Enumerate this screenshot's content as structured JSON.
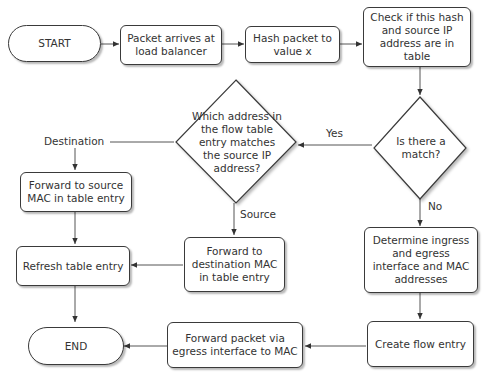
{
  "nodes": {
    "start": "START",
    "packet_arrives": "Packet arrives at load balancer",
    "hash_packet": "Hash packet to value x",
    "check_table": "Check if this hash and source IP address are in table",
    "is_match": "Is there a match?",
    "which_address": "Which address in the flow table entry matches the source IP address?",
    "forward_source_mac": "Forward to source MAC in table entry",
    "forward_dest_mac": "Forward to destination MAC in table entry",
    "refresh_entry": "Refresh table entry",
    "determine_interfaces": "Determine ingress and egress interface and MAC addresses",
    "create_flow": "Create flow entry",
    "forward_egress": "Forward packet via egress interface to MAC",
    "end": "END"
  },
  "edge_labels": {
    "yes": "Yes",
    "no": "No",
    "destination": "Destination",
    "source": "Source"
  }
}
